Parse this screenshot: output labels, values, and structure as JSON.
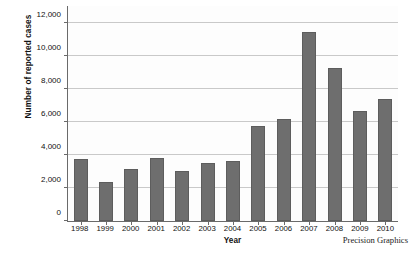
{
  "chart_data": {
    "type": "bar",
    "title": "",
    "xlabel": "Year",
    "ylabel": "Number of reported cases",
    "categories": [
      "1998",
      "1999",
      "2000",
      "2001",
      "2002",
      "2003",
      "2004",
      "2005",
      "2006",
      "2007",
      "2008",
      "2009",
      "2010"
    ],
    "values": [
      3750,
      2360,
      3150,
      3820,
      3030,
      3500,
      3640,
      5750,
      6180,
      11400,
      9280,
      6680,
      7400
    ],
    "ylim": [
      0,
      13000
    ],
    "y_ticks": [
      0,
      2000,
      4000,
      6000,
      8000,
      10000,
      12000
    ],
    "y_tick_labels": [
      "0",
      "2,000",
      "4,000",
      "6,000",
      "8,000",
      "10,000",
      "12,000"
    ],
    "grid": true,
    "legend": false,
    "legend_position": "none",
    "bar_color": "#6e6e6e",
    "axis_color": "#6a6a6a",
    "grid_color": "#c9c9c9",
    "background": "#fdfdfd"
  },
  "credit": "Precision Graphics"
}
